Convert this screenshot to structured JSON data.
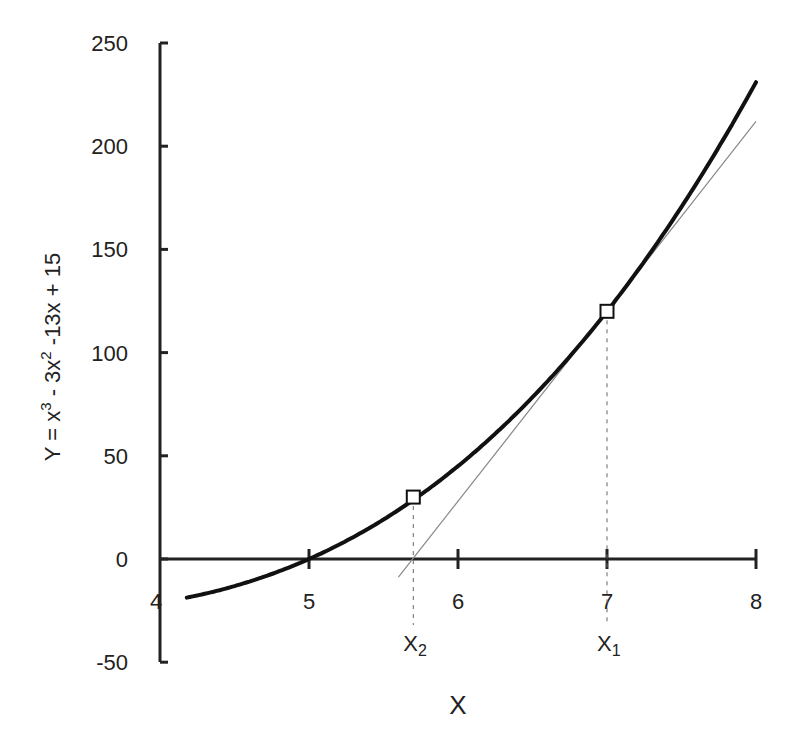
{
  "chart_data": {
    "type": "line",
    "title": "",
    "xlabel": "X",
    "ylabel": "Y = x³ - 3x² -13x + 15",
    "ylabel_parts": {
      "a": "Y = x",
      "a_sup": "3",
      "b": " - 3x",
      "b_sup": "2",
      "c": " -13x + 15"
    },
    "xlim": [
      4,
      8
    ],
    "ylim": [
      -50,
      250
    ],
    "x_ticks": [
      4,
      5,
      6,
      7,
      8
    ],
    "x_tick_labels": [
      "4",
      "5",
      "6",
      "7",
      "8"
    ],
    "y_ticks": [
      -50,
      0,
      50,
      100,
      150,
      200,
      250
    ],
    "y_tick_labels": [
      "-50",
      "0",
      "50",
      "100",
      "150",
      "200",
      "250"
    ],
    "grid": false,
    "legend": null,
    "series": [
      {
        "name": "f(x) = x^3 - 3x^2 - 13x + 15",
        "style": "thick-black",
        "x": [
          4.18,
          4.4,
          4.6,
          4.8,
          5.0,
          5.2,
          5.4,
          5.6,
          5.8,
          6.0,
          6.2,
          6.4,
          6.6,
          6.8,
          7.0,
          7.2,
          7.4,
          7.6,
          7.8,
          8.0
        ],
        "values": [
          -18.9,
          -15.9,
          -11.8,
          -6.5,
          0.0,
          7.9,
          17.2,
          27.9,
          40.0,
          57.0,
          72.3,
          89.7,
          109.2,
          129.8,
          120.0,
          142.3,
          165.9,
          190.9,
          217.4,
          231.0
        ]
      },
      {
        "name": "Tangent at x1 = 7",
        "style": "thin-gray",
        "x": [
          5.6,
          8.0
        ],
        "values": [
          -8.8,
          212.0
        ]
      }
    ],
    "points": [
      {
        "label": "X1",
        "label_main": "X",
        "label_sub": "1",
        "x": 7.0,
        "y": 120
      },
      {
        "label": "X2",
        "label_main": "X",
        "label_sub": "2",
        "x": 5.7,
        "y": 30
      }
    ],
    "annotations": [
      "X1",
      "X2"
    ]
  }
}
